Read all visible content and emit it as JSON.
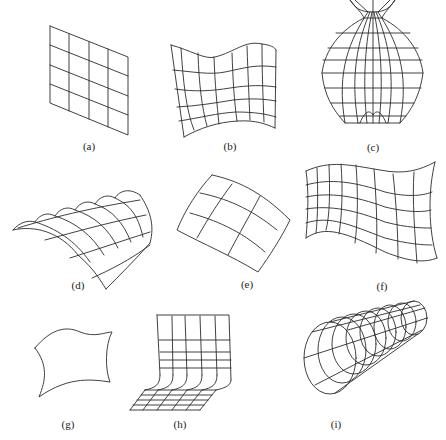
{
  "figure": {
    "stroke_color": "#2b2b2b",
    "background": "#ffffff",
    "panels": [
      {
        "id": "a",
        "label": "(a)",
        "shape": "flat sheared 4x4 planar grid"
      },
      {
        "id": "b",
        "label": "(b)",
        "shape": "wavy-top curved grid"
      },
      {
        "id": "c",
        "label": "(c)",
        "shape": "bulb / vase-like surface of revolution"
      },
      {
        "id": "d",
        "label": "(d)",
        "shape": "arched cylindrical sheet"
      },
      {
        "id": "e",
        "label": "(e)",
        "shape": "curved 3x3 patch"
      },
      {
        "id": "f",
        "label": "(f)",
        "shape": "waving flag grid"
      },
      {
        "id": "g",
        "label": "(g)",
        "shape": "curved outline of a sheet"
      },
      {
        "id": "h",
        "label": "(h)",
        "shape": "bent L-shaped sheet"
      },
      {
        "id": "i",
        "label": "(i)",
        "shape": "tapered tube of concentric rings"
      }
    ]
  }
}
